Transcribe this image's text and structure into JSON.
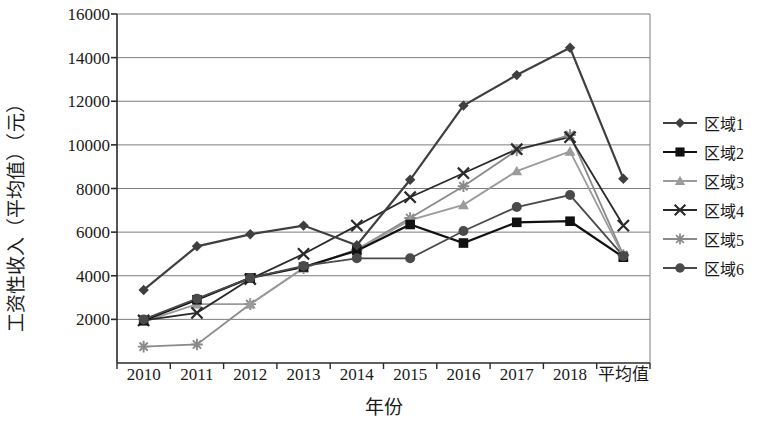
{
  "chart_data": {
    "type": "line",
    "title": "",
    "xlabel": "年份",
    "ylabel": "工资性收入（平均值）（元）",
    "categories": [
      "2010",
      "2011",
      "2012",
      "2013",
      "2014",
      "2015",
      "2016",
      "2017",
      "2018",
      "平均值"
    ],
    "ylim": [
      0,
      16000
    ],
    "ytick_labels": [
      "16000",
      "14000",
      "12000",
      "10000",
      "8000",
      "6000",
      "4000",
      "2000"
    ],
    "ytick_values": [
      16000,
      14000,
      12000,
      10000,
      8000,
      6000,
      4000,
      2000
    ],
    "grid": "horizontal",
    "legend_position": "right",
    "series": [
      {
        "name": "区域1",
        "marker": "diamond",
        "color": "#3f3f3f",
        "values": [
          3350,
          5350,
          5900,
          6300,
          5400,
          8400,
          11800,
          13200,
          14450,
          8450
        ]
      },
      {
        "name": "区域2",
        "marker": "square",
        "color": "#111111",
        "values": [
          1950,
          2900,
          3900,
          4400,
          5150,
          6350,
          5500,
          6450,
          6500,
          4850
        ]
      },
      {
        "name": "区域3",
        "marker": "triangle",
        "color": "#9b9b9b",
        "values": [
          1900,
          2700,
          2700,
          4350,
          5200,
          6550,
          7250,
          8800,
          9700,
          4900
        ]
      },
      {
        "name": "区域4",
        "marker": "cross",
        "color": "#2a2a2a",
        "values": [
          1950,
          2300,
          3850,
          5000,
          6300,
          7600,
          8700,
          9800,
          10350,
          6300
        ]
      },
      {
        "name": "区域5",
        "marker": "star",
        "color": "#8a8a8a",
        "values": [
          750,
          850,
          2700,
          4350,
          5200,
          6650,
          8100,
          9750,
          10450,
          4950
        ]
      },
      {
        "name": "区域6",
        "marker": "circle",
        "color": "#4a4a4a",
        "values": [
          2000,
          2950,
          3900,
          4450,
          4800,
          4800,
          6050,
          7150,
          7700,
          4900
        ]
      }
    ]
  }
}
